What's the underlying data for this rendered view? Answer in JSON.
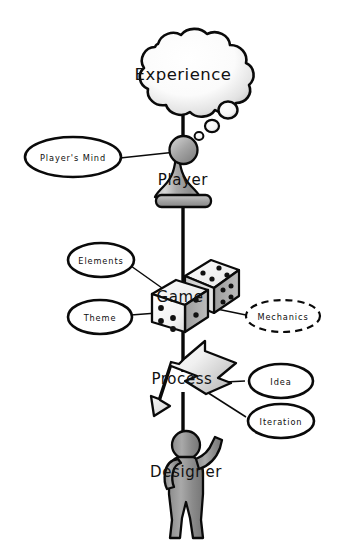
{
  "diagram": {
    "background_color": "#ffffff",
    "ink_color": "#0a0a0a",
    "spine_nodes": [
      {
        "id": "experience",
        "label": "Experience",
        "shape": "thought-cloud",
        "icon": "cloud-icon"
      },
      {
        "id": "player",
        "label": "Player",
        "shape": "pawn",
        "icon": "pawn-icon"
      },
      {
        "id": "game",
        "label": "Game",
        "shape": "dice-pair",
        "icon": "dice-icon"
      },
      {
        "id": "process",
        "label": "Process",
        "shape": "cycle-arrow",
        "icon": "cyclic-arrow-icon"
      },
      {
        "id": "designer",
        "label": "Designer",
        "shape": "person",
        "icon": "person-icon"
      }
    ],
    "satellites": [
      {
        "id": "players-mind",
        "label": "Player's Mind",
        "style": "solid",
        "attached_to": "player"
      },
      {
        "id": "elements",
        "label": "Elements",
        "style": "solid",
        "attached_to": "game"
      },
      {
        "id": "theme",
        "label": "Theme",
        "style": "solid",
        "attached_to": "game"
      },
      {
        "id": "mechanics",
        "label": "Mechanics",
        "style": "dashed",
        "attached_to": "game"
      },
      {
        "id": "idea",
        "label": "Idea",
        "style": "solid",
        "attached_to": "process"
      },
      {
        "id": "iteration",
        "label": "Iteration",
        "style": "solid",
        "attached_to": "process"
      }
    ],
    "thought_bubbles": 3
  }
}
